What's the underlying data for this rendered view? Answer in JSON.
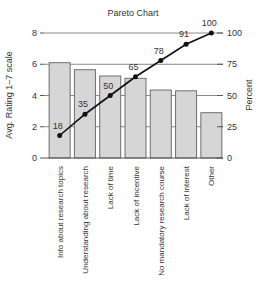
{
  "chart_data": {
    "type": "bar",
    "title": "Pareto Chart",
    "xlabel": "",
    "ylabel": "Avg. Rating 1–7 scale",
    "y2label": "Percent",
    "ylim": [
      0,
      8
    ],
    "y2lim": [
      0,
      100
    ],
    "yticks": [
      0,
      2,
      4,
      6,
      8
    ],
    "y2ticks": [
      0,
      25,
      50,
      75,
      100
    ],
    "grid": true,
    "legend": null,
    "categories": [
      "Info about research topics",
      "Understanding about research",
      "Lack of time",
      "Lack of incentive",
      "No mandatory research course",
      "Lack of interest",
      "Other"
    ],
    "series": [
      {
        "name": "Avg. Rating",
        "type": "bar",
        "axis": "left",
        "values": [
          6.1,
          5.65,
          5.25,
          5.1,
          4.35,
          4.3,
          2.9
        ]
      },
      {
        "name": "Cumulative Percent",
        "type": "line",
        "axis": "right",
        "values": [
          18,
          35,
          50,
          65,
          78,
          91,
          100
        ],
        "labels": [
          "18",
          "35",
          "50",
          "65",
          "78",
          "91",
          "100"
        ]
      }
    ]
  },
  "colors": {
    "bar_fill": "#d6d6d6",
    "bar_stroke": "#6e6e6e",
    "line": "#111111",
    "grid": "#8a8a8a",
    "axis": "#555555",
    "text": "#333333"
  }
}
